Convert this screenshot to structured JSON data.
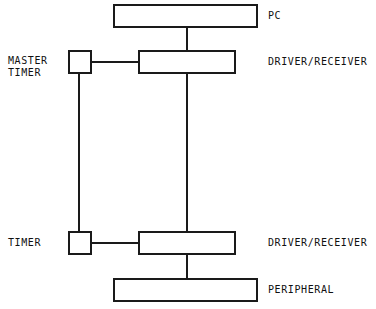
{
  "diagram": {
    "stroke_color": "#1a1a1a",
    "fill_color": "#ffffff",
    "text_color": "#111111",
    "nodes": [
      {
        "id": "pc",
        "label": "",
        "shape": "rect",
        "x": 113,
        "y": 4,
        "w": 145,
        "h": 24
      },
      {
        "id": "master-timer",
        "label": "",
        "shape": "rect",
        "x": 68,
        "y": 50,
        "w": 24,
        "h": 24
      },
      {
        "id": "driver-top",
        "label": "",
        "shape": "rect",
        "x": 138,
        "y": 50,
        "w": 98,
        "h": 24
      },
      {
        "id": "timer",
        "label": "",
        "shape": "rect",
        "x": 68,
        "y": 231,
        "w": 24,
        "h": 24
      },
      {
        "id": "driver-bottom",
        "label": "",
        "shape": "rect",
        "x": 138,
        "y": 231,
        "w": 98,
        "h": 24
      },
      {
        "id": "peripheral",
        "label": "",
        "shape": "rect",
        "x": 113,
        "y": 278,
        "w": 145,
        "h": 24
      }
    ],
    "labels": {
      "pc": "PC",
      "driver_receiver_top": "DRIVER/RECEIVER",
      "driver_receiver_bottom": "DRIVER/RECEIVER",
      "peripheral": "PERIPHERAL",
      "master_timer_line1": "MASTER",
      "master_timer_line2": "TIMER",
      "timer": "TIMER"
    },
    "connections": [
      {
        "id": "pc-to-driver-top",
        "from": "pc",
        "to": "driver-top",
        "orientation": "vertical",
        "x": 186,
        "y": 27,
        "length": 24
      },
      {
        "id": "master-timer-to-driver",
        "from": "master-timer",
        "to": "driver-top",
        "orientation": "horizontal",
        "x": 91,
        "y": 61,
        "length": 48
      },
      {
        "id": "timer-bus",
        "from": "master-timer",
        "to": "timer",
        "orientation": "vertical",
        "x": 78,
        "y": 73,
        "length": 159
      },
      {
        "id": "driver-bus",
        "from": "driver-top",
        "to": "driver-bottom",
        "orientation": "vertical",
        "x": 186,
        "y": 73,
        "length": 159
      },
      {
        "id": "timer-to-driver-bottom",
        "from": "timer",
        "to": "driver-bottom",
        "orientation": "horizontal",
        "x": 91,
        "y": 242,
        "length": 48
      },
      {
        "id": "driver-to-peripheral",
        "from": "driver-bottom",
        "to": "peripheral",
        "orientation": "vertical",
        "x": 186,
        "y": 254,
        "length": 25
      }
    ]
  }
}
